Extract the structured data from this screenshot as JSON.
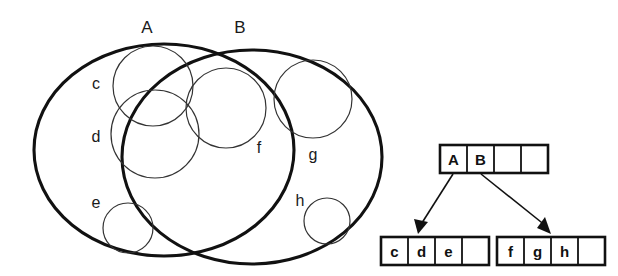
{
  "figure": {
    "venn": {
      "outer_sets": [
        {
          "id": "A",
          "label": "A",
          "cx": 164,
          "cy": 150,
          "rx": 130,
          "ry": 106,
          "label_x": 147,
          "label_y": 33
        },
        {
          "id": "B",
          "label": "B",
          "cx": 252,
          "cy": 157,
          "rx": 130,
          "ry": 107,
          "label_x": 240,
          "label_y": 33
        }
      ],
      "inner_sets": [
        {
          "id": "c",
          "label": "c",
          "cx": 153,
          "cy": 86,
          "r": 40,
          "label_x": 96,
          "label_y": 89
        },
        {
          "id": "d",
          "label": "d",
          "cx": 155,
          "cy": 134,
          "r": 44,
          "label_x": 96,
          "label_y": 142
        },
        {
          "id": "e",
          "label": "e",
          "cx": 128,
          "cy": 228,
          "r": 25,
          "label_x": 96,
          "label_y": 208
        },
        {
          "id": "f",
          "label": "f",
          "cx": 226,
          "cy": 108,
          "r": 40,
          "label_x": 259,
          "label_y": 153
        },
        {
          "id": "g",
          "label": "g",
          "cx": 313,
          "cy": 99,
          "r": 39,
          "label_x": 313,
          "label_y": 160
        },
        {
          "id": "h",
          "label": "h",
          "cx": 327,
          "cy": 221,
          "r": 23,
          "label_x": 300,
          "label_y": 206
        }
      ]
    },
    "tree": {
      "root_node": {
        "name": "root-node",
        "x": 440,
        "y": 145,
        "width": 108,
        "height": 28,
        "cells": [
          "A",
          "B",
          "",
          ""
        ]
      },
      "leaf_nodes": [
        {
          "name": "leaf-node-left",
          "x": 381,
          "y": 237,
          "width": 108,
          "height": 28,
          "cells": [
            "c",
            "d",
            "e",
            ""
          ]
        },
        {
          "name": "leaf-node-right",
          "x": 497,
          "y": 237,
          "width": 108,
          "height": 28,
          "cells": [
            "f",
            "g",
            "h",
            ""
          ]
        }
      ],
      "edges": [
        {
          "name": "edge-a-to-left-leaf",
          "from_cell": "A",
          "to_node": "leaf-node-left",
          "x1": 453,
          "y1": 175,
          "x2": 424,
          "y2": 231
        },
        {
          "name": "edge-b-to-right-leaf",
          "from_cell": "B",
          "to_node": "leaf-node-right",
          "x1": 481,
          "y1": 175,
          "x2": 546,
          "y2": 231
        }
      ]
    },
    "colors": {
      "stroke_heavy": "#111111",
      "stroke_light": "#333333",
      "background": "#ffffff",
      "text": "#1a1a1a"
    }
  }
}
